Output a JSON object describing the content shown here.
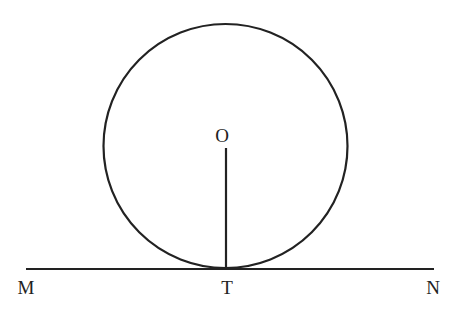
{
  "diagram": {
    "colors": {
      "stroke": "#222222",
      "background": "#ffffff"
    },
    "circle": {
      "center_label": "O",
      "cx": 225.5,
      "cy": 146,
      "r": 122
    },
    "radius_segment": {
      "from": "O",
      "to": "T",
      "x": 226,
      "y1": 148,
      "y2": 269
    },
    "tangent_line": {
      "label": "MN",
      "x1": 26,
      "x2": 434,
      "y": 269
    },
    "points": {
      "O": {
        "label": "O",
        "x": 222,
        "y": 142
      },
      "M": {
        "label": "M",
        "x": 26,
        "y": 294
      },
      "T": {
        "label": "T",
        "x": 227,
        "y": 294
      },
      "N": {
        "label": "N",
        "x": 433,
        "y": 294
      }
    }
  }
}
